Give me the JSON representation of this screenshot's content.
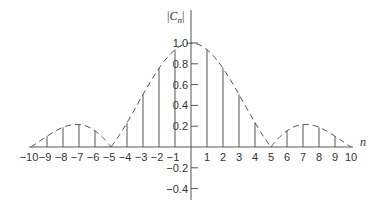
{
  "chart_data": {
    "type": "stem",
    "title": "",
    "xlabel": "n",
    "ylabel": "|C_n|",
    "ylabel_display": {
      "bar_open": "|",
      "main": "C",
      "sub": "n",
      "bar_close": "|"
    },
    "x": [
      -10,
      -9,
      -8,
      -7,
      -6,
      -5,
      -4,
      -3,
      -2,
      -1,
      0,
      1,
      2,
      3,
      4,
      5,
      6,
      7,
      8,
      9,
      10
    ],
    "values": [
      0,
      0.104,
      0.189,
      0.216,
      0.156,
      0,
      0.234,
      0.505,
      0.757,
      0.935,
      1.0,
      0.935,
      0.757,
      0.505,
      0.234,
      0,
      0.156,
      0.216,
      0.189,
      0.104,
      0
    ],
    "envelope": {
      "style": "dashed",
      "description": "|sinc(n/5)| envelope"
    },
    "x_tick_labels": [
      "−10",
      "−9",
      "−8",
      "−7",
      "−6",
      "−5",
      "−4",
      "−3",
      "−2",
      "−1",
      "",
      "1",
      "2",
      "3",
      "4",
      "5",
      "6",
      "7",
      "8",
      "9",
      "10"
    ],
    "y_ticks": [
      1.0,
      0.8,
      0.6,
      0.4,
      0.2,
      -0.2,
      -0.4
    ],
    "y_tick_labels": [
      "1.0",
      "0.8",
      "0.6",
      "0.4",
      "0.2",
      "−0.2",
      "−0.4"
    ],
    "xlim": [
      -10,
      10
    ],
    "ylim": [
      -0.45,
      1.2
    ],
    "grid": false,
    "legend": null,
    "colors": {
      "line": "#555555",
      "text": "#333333",
      "background": "#ffffff"
    }
  }
}
